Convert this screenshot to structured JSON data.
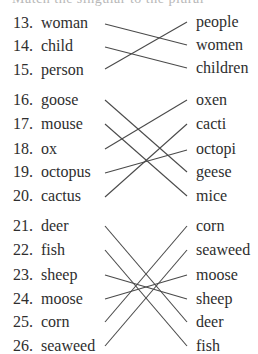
{
  "header_cut_text": "Match the singular to the plural",
  "line_color": "#4a4a4a",
  "text_color": "#2e2e2e",
  "sections": [
    {
      "items": [
        {
          "num": "13.",
          "left": "woman",
          "right": "people",
          "left_y": 23,
          "right_y": 22
        },
        {
          "num": "14.",
          "left": "child",
          "right": "women",
          "left_y": 46,
          "right_y": 45
        },
        {
          "num": "15.",
          "left": "person",
          "right": "children",
          "left_y": 70,
          "right_y": 68
        }
      ],
      "matches": [
        {
          "from": "woman",
          "to": "women"
        },
        {
          "from": "child",
          "to": "children"
        },
        {
          "from": "person",
          "to": "people"
        }
      ]
    },
    {
      "items": [
        {
          "num": "16.",
          "left": "goose",
          "right": "oxen",
          "left_y": 100,
          "right_y": 100
        },
        {
          "num": "17.",
          "left": "mouse",
          "right": "cacti",
          "left_y": 124,
          "right_y": 124
        },
        {
          "num": "18.",
          "left": "ox",
          "right": "octopi",
          "left_y": 149,
          "right_y": 149
        },
        {
          "num": "19.",
          "left": "octopus",
          "right": "geese",
          "left_y": 172,
          "right_y": 172
        },
        {
          "num": "20.",
          "left": "cactus",
          "right": "mice",
          "left_y": 196,
          "right_y": 196
        }
      ],
      "matches": [
        {
          "from": "goose",
          "to": "geese"
        },
        {
          "from": "mouse",
          "to": "mice"
        },
        {
          "from": "ox",
          "to": "oxen"
        },
        {
          "from": "octopus",
          "to": "octopi"
        },
        {
          "from": "cactus",
          "to": "cacti"
        }
      ]
    },
    {
      "items": [
        {
          "num": "21.",
          "left": "deer",
          "right": "corn",
          "left_y": 226,
          "right_y": 226
        },
        {
          "num": "22.",
          "left": "fish",
          "right": "seaweed",
          "left_y": 250,
          "right_y": 250
        },
        {
          "num": "23.",
          "left": "sheep",
          "right": "moose",
          "left_y": 275,
          "right_y": 275
        },
        {
          "num": "24.",
          "left": "moose",
          "right": "sheep",
          "left_y": 299,
          "right_y": 299
        },
        {
          "num": "25.",
          "left": "corn",
          "right": "deer",
          "left_y": 322,
          "right_y": 322
        },
        {
          "num": "26.",
          "left": "seaweed",
          "right": "fish",
          "left_y": 346,
          "right_y": 346
        }
      ],
      "matches": [
        {
          "from": "deer",
          "to": "deer"
        },
        {
          "from": "fish",
          "to": "fish"
        },
        {
          "from": "sheep",
          "to": "sheep"
        },
        {
          "from": "moose",
          "to": "moose"
        },
        {
          "from": "corn",
          "to": "corn"
        },
        {
          "from": "seaweed",
          "to": "seaweed"
        }
      ]
    }
  ]
}
